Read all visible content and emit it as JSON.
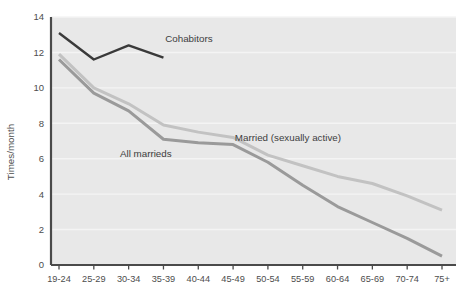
{
  "chart_data": {
    "type": "line",
    "title": "",
    "xlabel": "",
    "ylabel": "Times/month",
    "ylim": [
      0,
      14
    ],
    "yticks": [
      0,
      2,
      4,
      6,
      8,
      10,
      12,
      14
    ],
    "grid": true,
    "legend_position": "inline-annotations",
    "categories": [
      "19-24",
      "25-29",
      "30-34",
      "35-39",
      "40-44",
      "45-49",
      "50-54",
      "55-59",
      "60-64",
      "65-69",
      "70-74",
      "75+"
    ],
    "series": [
      {
        "name": "Cohabitors",
        "color": "#3a3a3a",
        "values": [
          13.1,
          11.6,
          12.4,
          11.7,
          null,
          null,
          null,
          null,
          null,
          null,
          null,
          null
        ]
      },
      {
        "name": "Married (sexually active)",
        "color": "#c2c2c2",
        "values": [
          11.9,
          10.0,
          9.1,
          7.9,
          7.5,
          7.2,
          6.2,
          5.6,
          5.0,
          4.6,
          3.9,
          3.1
        ]
      },
      {
        "name": "All marrieds",
        "color": "#9a9a9a",
        "values": [
          11.6,
          9.7,
          8.7,
          7.1,
          6.9,
          6.8,
          5.8,
          4.5,
          3.3,
          2.4,
          1.5,
          0.5
        ]
      }
    ],
    "annotations": [
      {
        "text": "Cohabitors",
        "x_index": 3.05,
        "y_value": 12.6
      },
      {
        "text": "All marrieds",
        "x_index": 1.75,
        "y_value": 6.1
      },
      {
        "text": "Married (sexually active)",
        "x_index": 5.05,
        "y_value": 7.0
      }
    ]
  },
  "axis": {
    "y_title": "Times/month",
    "y_tick_labels": [
      "0",
      "2",
      "4",
      "6",
      "8",
      "10",
      "12",
      "14"
    ],
    "x_tick_labels": [
      "19-24",
      "25-29",
      "30-34",
      "35-39",
      "40-44",
      "45-49",
      "50-54",
      "55-59",
      "60-64",
      "65-69",
      "70-74",
      "75+"
    ]
  },
  "colors": {
    "plot_background": "#e8e8e8",
    "gridline": "#f4f4f4",
    "axis_line": "#4a4a4a",
    "cohabitors": "#3a3a3a",
    "married_sexually_active": "#c2c2c2",
    "all_marrieds": "#9a9a9a"
  }
}
